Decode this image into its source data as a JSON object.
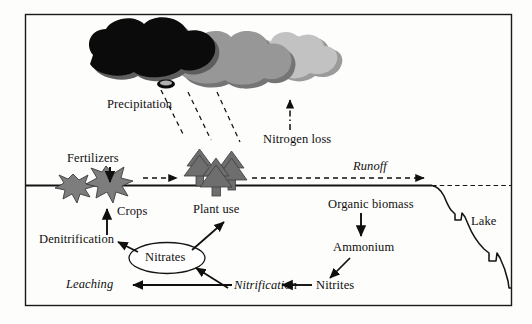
{
  "figure": {
    "kind": "nitrogen-cycle-diagram",
    "frame": {
      "stroke": "#1a1a1a"
    },
    "background": "#fdfdfc"
  },
  "colors": {
    "ink": "#100f0e",
    "cloud_dark": "#0b0b0b",
    "cloud_mid": "#8f8f8f",
    "cloud_light": "#bdbdbd",
    "cloud_shadow": "#6f6f6f",
    "tree_gray": "#6b6b6b",
    "crop_gray": "#7a7a7a",
    "line": "#1a1a1a"
  },
  "labels": {
    "precipitation": "Precipitation",
    "nitrogen_loss": "Nitrogen loss",
    "fertilizers": "Fertilizers",
    "crops": "Crops",
    "plant_use": "Plant use",
    "runoff": "Runoff",
    "organic_biomass": "Organic biomass",
    "lake": "Lake",
    "ammonium": "Ammonium",
    "nitrites": "Nitrites",
    "nitrification": "Nitrification",
    "nitrates": "Nitrates",
    "leaching": "Leaching",
    "denitrification": "Denitrification"
  },
  "shapes": {
    "clouds": [
      {
        "name": "dark-cloud",
        "fill_key": "cloud_dark"
      },
      {
        "name": "mid-cloud",
        "fill_key": "cloud_mid"
      },
      {
        "name": "light-cloud",
        "fill_key": "cloud_light"
      }
    ],
    "trees_count": 3,
    "crops_count": 2,
    "rain_lines_count": 3
  },
  "flows": [
    {
      "from": "Clouds",
      "to": "Plant use",
      "style": "dashed",
      "label": "Precipitation"
    },
    {
      "from": "Ground",
      "to": "Clouds",
      "style": "dash-dot",
      "label": "Nitrogen loss"
    },
    {
      "from": "Fertilizers",
      "to": "Crops",
      "style": "solid",
      "label": "Fertilizers"
    },
    {
      "from": "Crops",
      "to": "Lake",
      "style": "dashed",
      "label": "Runoff"
    },
    {
      "from": "Nitrates",
      "to": "Crops",
      "style": "solid",
      "label": "Crops"
    },
    {
      "from": "Nitrates",
      "to": "Denitrification",
      "style": "solid",
      "label": "Denitrification"
    },
    {
      "from": "Nitrates",
      "to": "Plant use",
      "style": "solid",
      "label": "Plant use"
    },
    {
      "from": "Nitrification",
      "to": "Nitrates",
      "style": "solid",
      "label": "Nitrification"
    },
    {
      "from": "Nitrates",
      "to": "Leaching",
      "style": "solid",
      "label": "Leaching"
    },
    {
      "from": "Organic biomass",
      "to": "Ammonium",
      "style": "solid",
      "label": "Organic biomass"
    },
    {
      "from": "Ammonium",
      "to": "Nitrites",
      "style": "solid",
      "label": "Ammonium"
    },
    {
      "from": "Nitrites",
      "to": "Nitrification",
      "style": "solid",
      "label": "Nitrites"
    }
  ]
}
